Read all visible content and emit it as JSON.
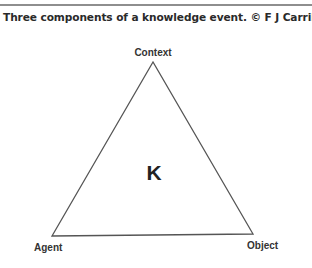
{
  "caption": "Three components of a knowledge event. © F J Carrillo, 1998",
  "diagram": {
    "shape": "triangle",
    "center_label": "K",
    "vertices": {
      "top": "Context",
      "bottom_left": "Agent",
      "bottom_right": "Object"
    },
    "colors": {
      "stroke": "#555555",
      "text": "#333333",
      "rule": "#8e8e8e"
    }
  }
}
